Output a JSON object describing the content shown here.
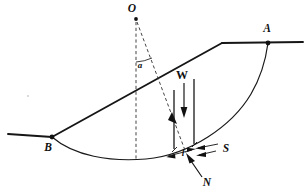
{
  "figure": {
    "kind": "slope-stability-method-of-slices",
    "background_color": "#ffffff",
    "ink_color": "#111111",
    "labels": {
      "center_of_rotation": "O",
      "crest_point": "A",
      "toe_point": "B",
      "angle": "a",
      "slice_weight": "W",
      "shear_force": "S",
      "normal_force": "N",
      "base_length": "l"
    },
    "geometry": {
      "center_of_rotation": {
        "x": 136,
        "y": 18
      },
      "crest_point": {
        "x": 268,
        "y": 43
      },
      "toe_point": {
        "x": 52,
        "y": 137
      },
      "crest_break": {
        "x": 222,
        "y": 43
      },
      "left_ground_start": {
        "x": 8,
        "y": 134
      },
      "right_ground_end": {
        "x": 303,
        "y": 42
      },
      "slice_left_x": 174,
      "slice_right_x": 194,
      "arc_low_point": {
        "x": 140,
        "y": 159
      }
    }
  }
}
